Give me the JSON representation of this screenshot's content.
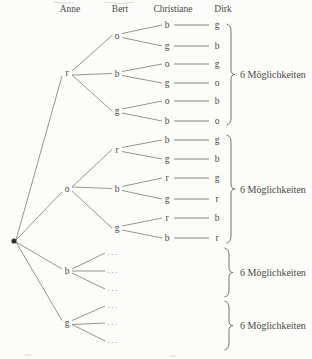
{
  "diagram": {
    "columns": [
      "Anne",
      "Bert",
      "Christiane",
      "Dirk"
    ],
    "brace_label": "6 Möglichkeiten",
    "ellipsis": "...",
    "groups": [
      {
        "anne": "r",
        "bert": [
          {
            "label": "o",
            "children": [
              {
                "christiane": "b",
                "dirk": "g"
              },
              {
                "christiane": "g",
                "dirk": "b"
              }
            ]
          },
          {
            "label": "b",
            "children": [
              {
                "christiane": "o",
                "dirk": "g"
              },
              {
                "christiane": "g",
                "dirk": "o"
              }
            ]
          },
          {
            "label": "g",
            "children": [
              {
                "christiane": "o",
                "dirk": "b"
              },
              {
                "christiane": "b",
                "dirk": "o"
              }
            ]
          }
        ]
      },
      {
        "anne": "o",
        "bert": [
          {
            "label": "r",
            "children": [
              {
                "christiane": "b",
                "dirk": "g"
              },
              {
                "christiane": "g",
                "dirk": "b"
              }
            ]
          },
          {
            "label": "b",
            "children": [
              {
                "christiane": "r",
                "dirk": "g"
              },
              {
                "christiane": "g",
                "dirk": "r"
              }
            ]
          },
          {
            "label": "g",
            "children": [
              {
                "christiane": "r",
                "dirk": "b"
              },
              {
                "christiane": "b",
                "dirk": "r"
              }
            ]
          }
        ]
      },
      {
        "anne": "b",
        "ellipsis_rows": 3
      },
      {
        "anne": "g",
        "ellipsis_rows": 3
      }
    ],
    "braces": [
      {
        "label": "6 Möglichkeiten"
      },
      {
        "label": "6 Möglichkeiten"
      },
      {
        "label": "6 Möglichkeiten"
      },
      {
        "label": "6 Möglichkeiten"
      }
    ]
  }
}
